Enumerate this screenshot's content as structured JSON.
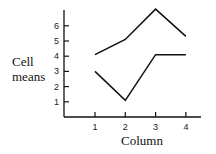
{
  "chart_data": {
    "type": "line",
    "title": "",
    "xlabel": "Column",
    "ylabel": "Cell means",
    "categories": [
      "1",
      "2",
      "3",
      "4"
    ],
    "x": [
      1,
      2,
      3,
      4
    ],
    "yticks": [
      "1",
      "2",
      "3",
      "4",
      "5",
      "6"
    ],
    "ylim": [
      0,
      7
    ],
    "grid": false,
    "legend": null,
    "series": [
      {
        "name": "upper",
        "values": [
          4.1,
          5.1,
          7.1,
          5.3
        ]
      },
      {
        "name": "lower",
        "values": [
          3.0,
          1.1,
          4.1,
          4.1
        ]
      }
    ]
  },
  "colors": {
    "line": "#111111",
    "axis": "#111111"
  }
}
